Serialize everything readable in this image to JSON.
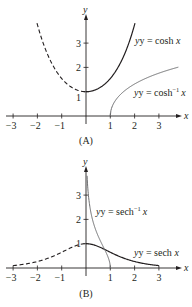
{
  "chart_data": [
    {
      "panel": "A",
      "caption": "(A)",
      "type": "line",
      "xlabel": "x",
      "ylabel": "y",
      "xlim": [
        -3,
        3.8
      ],
      "ylim": [
        0,
        3.8
      ],
      "x_ticks": [
        "−3",
        "−2",
        "−1",
        "1",
        "2",
        "3"
      ],
      "y_ticks": [
        "1",
        "2",
        "3"
      ],
      "grid": false,
      "series": [
        {
          "name": "y = cosh x",
          "label_main": "y = cosh ",
          "label_var": "x",
          "style": "solid",
          "domain": [
            0,
            2.03
          ],
          "func": "cosh",
          "color": "#231f20"
        },
        {
          "name": "cosh x (x<0)",
          "style": "dashed",
          "domain": [
            -2.03,
            0
          ],
          "func": "cosh",
          "color": "#231f20"
        },
        {
          "name": "y = cosh^-1 x",
          "label_main": "y = cosh",
          "label_sup": "−1",
          "label_var": "x",
          "style": "solid",
          "domain": [
            1,
            3.8
          ],
          "func": "arccosh",
          "color": "#6d6e70"
        }
      ]
    },
    {
      "panel": "B",
      "caption": "(B)",
      "type": "line",
      "xlabel": "x",
      "ylabel": "y",
      "xlim": [
        -3,
        3.8
      ],
      "ylim": [
        0,
        3.8
      ],
      "x_ticks": [
        "−3",
        "−2",
        "−1",
        "1",
        "2",
        "3"
      ],
      "y_ticks": [
        "1",
        "2",
        "3"
      ],
      "grid": false,
      "series": [
        {
          "name": "y = sech x",
          "label_main": "y = sech ",
          "label_var": "x",
          "style": "solid",
          "domain": [
            0,
            3
          ],
          "func": "sech",
          "color": "#231f20"
        },
        {
          "name": "sech x (x<0)",
          "style": "dashed",
          "domain": [
            -3,
            0
          ],
          "func": "sech",
          "color": "#231f20"
        },
        {
          "name": "y = sech^-1 x",
          "label_main": "y = sech",
          "label_sup": "−1",
          "label_var": "x",
          "style": "solid",
          "domain": [
            0.045,
            1
          ],
          "func": "arcsech",
          "color": "#6d6e70"
        }
      ]
    }
  ]
}
